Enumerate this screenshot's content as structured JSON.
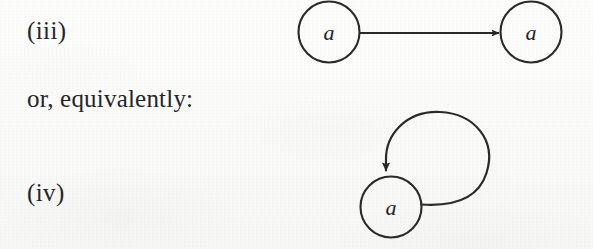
{
  "page": {
    "background_color": "#fbfbf9",
    "ink_color": "#262626"
  },
  "labels": {
    "item_iii": "(iii)",
    "connector_text": "or, equivalently:",
    "item_iv": "(iv)"
  },
  "figures": [
    {
      "id": "figure-iii",
      "caption_ref": "(iii)",
      "type": "directed-graph",
      "nodes": [
        {
          "id": "node-left",
          "label": "a",
          "cx": 329,
          "cy": 32,
          "r": 31
        },
        {
          "id": "node-right",
          "label": "a",
          "cx": 531,
          "cy": 32,
          "r": 31
        }
      ],
      "edges": [
        {
          "id": "edge-left-to-right",
          "from": "node-left",
          "to": "node-right",
          "arrowhead": "filled-triangle",
          "direction": "rightward"
        }
      ]
    },
    {
      "id": "figure-iv",
      "caption_ref": "(iv)",
      "type": "directed-graph",
      "nodes": [
        {
          "id": "node-self",
          "label": "a",
          "cx": 391,
          "cy": 207,
          "r": 31
        }
      ],
      "edges": [
        {
          "id": "edge-self-loop",
          "from": "node-self",
          "to": "node-self",
          "arrowhead": "filled-triangle",
          "direction": "downward-into-top",
          "loop_cx": 438,
          "loop_cy": 163,
          "loop_r": 51
        }
      ]
    }
  ],
  "node_labels": {
    "iii_left": "a",
    "iii_right": "a",
    "iv_self": "a"
  }
}
